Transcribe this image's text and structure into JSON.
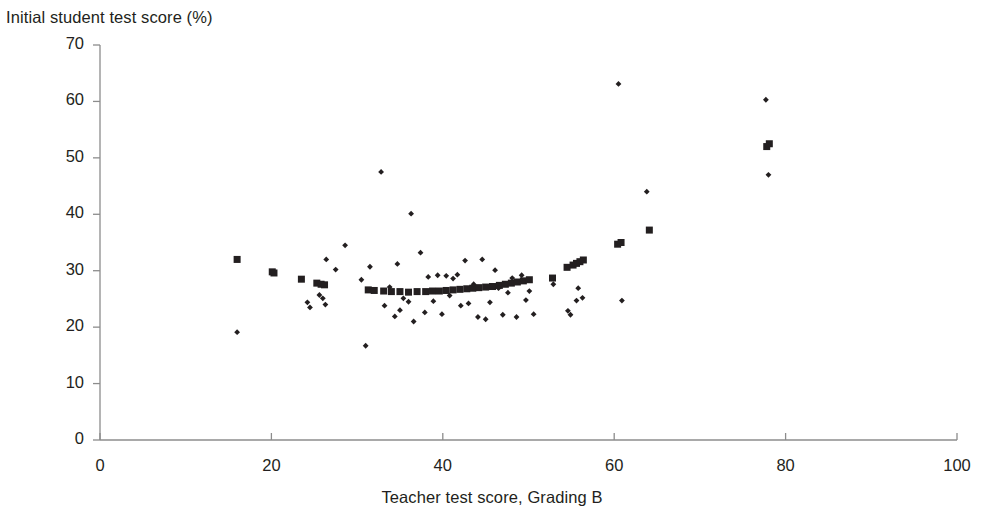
{
  "chart_data": {
    "type": "scatter",
    "title": "",
    "ylabel": "Initial student test score (%)",
    "xlabel": "Teacher test score, Grading B",
    "xlim": [
      0,
      100
    ],
    "ylim": [
      0,
      70
    ],
    "xticks": [
      0,
      20,
      40,
      60,
      80,
      100
    ],
    "yticks": [
      0,
      10,
      20,
      30,
      40,
      50,
      60,
      70
    ],
    "xtick_labels": [
      "0",
      "20",
      "40",
      "60",
      "80",
      "100"
    ],
    "ytick_labels": [
      "0",
      "10",
      "20",
      "30",
      "40",
      "50",
      "60",
      "70"
    ],
    "grid": false,
    "legend": "none",
    "axis_color": "#8c8c8c",
    "marker_color": "#231f20",
    "series": [
      {
        "name": "observations",
        "marker": "diamond",
        "marker_size": 5,
        "color": "#231f20",
        "points": [
          [
            16.0,
            19.1
          ],
          [
            24.2,
            24.4
          ],
          [
            24.5,
            23.5
          ],
          [
            25.6,
            25.7
          ],
          [
            26.0,
            25.1
          ],
          [
            26.3,
            24.0
          ],
          [
            26.4,
            32.0
          ],
          [
            27.5,
            30.2
          ],
          [
            28.6,
            34.5
          ],
          [
            30.5,
            28.4
          ],
          [
            31.0,
            16.7
          ],
          [
            31.5,
            30.7
          ],
          [
            32.8,
            47.5
          ],
          [
            33.2,
            23.8
          ],
          [
            33.8,
            27.1
          ],
          [
            34.4,
            21.9
          ],
          [
            34.7,
            31.2
          ],
          [
            35.0,
            23.0
          ],
          [
            35.4,
            25.1
          ],
          [
            36.0,
            24.5
          ],
          [
            36.3,
            40.1
          ],
          [
            36.6,
            21.0
          ],
          [
            37.4,
            33.2
          ],
          [
            37.9,
            22.6
          ],
          [
            38.3,
            28.9
          ],
          [
            38.9,
            24.6
          ],
          [
            39.4,
            29.2
          ],
          [
            39.9,
            22.3
          ],
          [
            40.4,
            29.1
          ],
          [
            40.8,
            25.6
          ],
          [
            41.2,
            28.6
          ],
          [
            41.7,
            29.3
          ],
          [
            42.1,
            23.8
          ],
          [
            42.6,
            31.8
          ],
          [
            43.0,
            24.2
          ],
          [
            43.6,
            27.6
          ],
          [
            44.1,
            21.8
          ],
          [
            44.6,
            32.0
          ],
          [
            45.0,
            21.4
          ],
          [
            45.5,
            24.4
          ],
          [
            46.1,
            30.1
          ],
          [
            46.5,
            26.9
          ],
          [
            47.0,
            22.2
          ],
          [
            47.6,
            26.1
          ],
          [
            48.1,
            28.7
          ],
          [
            48.6,
            21.8
          ],
          [
            49.2,
            29.2
          ],
          [
            49.7,
            24.8
          ],
          [
            50.1,
            26.4
          ],
          [
            50.6,
            22.3
          ],
          [
            52.9,
            27.6
          ],
          [
            54.6,
            22.9
          ],
          [
            54.9,
            22.2
          ],
          [
            55.6,
            24.7
          ],
          [
            55.8,
            26.9
          ],
          [
            56.3,
            25.2
          ],
          [
            60.5,
            63.1
          ],
          [
            60.9,
            24.7
          ],
          [
            63.8,
            44.0
          ],
          [
            77.7,
            60.3
          ],
          [
            78.0,
            47.0
          ]
        ]
      },
      {
        "name": "fitted",
        "marker": "square",
        "marker_size": 7,
        "color": "#231f20",
        "points": [
          [
            16.0,
            32.0
          ],
          [
            20.1,
            29.8
          ],
          [
            20.3,
            29.6
          ],
          [
            23.5,
            28.5
          ],
          [
            25.3,
            27.8
          ],
          [
            25.8,
            27.6
          ],
          [
            26.2,
            27.5
          ],
          [
            31.3,
            26.6
          ],
          [
            32.0,
            26.5
          ],
          [
            33.1,
            26.4
          ],
          [
            34.0,
            26.3
          ],
          [
            35.0,
            26.3
          ],
          [
            36.0,
            26.2
          ],
          [
            37.0,
            26.3
          ],
          [
            38.0,
            26.3
          ],
          [
            38.8,
            26.4
          ],
          [
            39.6,
            26.4
          ],
          [
            40.4,
            26.5
          ],
          [
            41.2,
            26.6
          ],
          [
            42.0,
            26.7
          ],
          [
            42.8,
            26.8
          ],
          [
            43.5,
            26.9
          ],
          [
            44.2,
            27.0
          ],
          [
            45.0,
            27.1
          ],
          [
            45.8,
            27.2
          ],
          [
            46.6,
            27.4
          ],
          [
            47.3,
            27.6
          ],
          [
            48.0,
            27.8
          ],
          [
            48.7,
            28.0
          ],
          [
            49.4,
            28.2
          ],
          [
            50.1,
            28.4
          ],
          [
            52.8,
            28.7
          ],
          [
            54.5,
            30.6
          ],
          [
            55.2,
            31.0
          ],
          [
            55.6,
            31.3
          ],
          [
            56.0,
            31.6
          ],
          [
            56.4,
            31.9
          ],
          [
            60.4,
            34.7
          ],
          [
            60.8,
            35.0
          ],
          [
            64.1,
            37.2
          ],
          [
            77.8,
            52.0
          ],
          [
            78.1,
            52.5
          ]
        ]
      }
    ]
  },
  "axes_geometry": {
    "x0_px": 100,
    "x1_px": 957,
    "y0_px": 440,
    "y1_px": 45
  }
}
